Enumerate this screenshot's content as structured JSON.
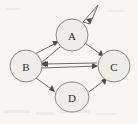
{
  "diagram": {
    "type": "directed-graph",
    "background_color": "#f7f6f4",
    "node_fill": "#efedea",
    "node_stroke": "#8d8a86",
    "edge_color": "#6f6c69",
    "label_color": "#2e2c2a",
    "nodes": [
      {
        "id": "A",
        "label": "A",
        "cx": 72,
        "cy": 35,
        "rx": 16,
        "ry": 16
      },
      {
        "id": "B",
        "label": "B",
        "cx": 26,
        "cy": 66,
        "rx": 16,
        "ry": 16
      },
      {
        "id": "C",
        "label": "C",
        "cx": 114,
        "cy": 66,
        "rx": 16,
        "ry": 16
      },
      {
        "id": "D",
        "label": "D",
        "cx": 72,
        "cy": 97,
        "rx": 17,
        "ry": 15
      }
    ],
    "edges": [
      {
        "from": "A",
        "to": "A",
        "kind": "self-loop"
      },
      {
        "from": "B",
        "to": "A",
        "kind": "straight"
      },
      {
        "from": "A",
        "to": "B",
        "kind": "straight"
      },
      {
        "from": "A",
        "to": "C",
        "kind": "straight"
      },
      {
        "from": "B",
        "to": "C",
        "kind": "straight"
      },
      {
        "from": "C",
        "to": "B",
        "kind": "straight"
      },
      {
        "from": "B",
        "to": "D",
        "kind": "straight"
      },
      {
        "from": "D",
        "to": "C",
        "kind": "straight"
      }
    ]
  }
}
